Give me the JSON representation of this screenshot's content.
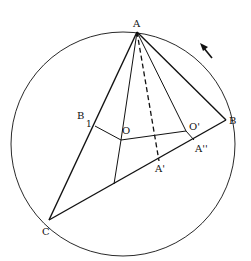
{
  "figure": {
    "type": "geometry-diagram",
    "circle": {
      "cx": 123,
      "cy": 144,
      "r": 112
    },
    "points": {
      "A": {
        "x": 137,
        "y": 32,
        "label": "A"
      },
      "B": {
        "x": 226,
        "y": 120,
        "label": "B"
      },
      "C": {
        "x": 49,
        "y": 220,
        "label": "C"
      },
      "B1": {
        "x": 95,
        "y": 126,
        "label": "B",
        "subscript": "1"
      },
      "O": {
        "x": 121,
        "y": 140,
        "label": "O"
      },
      "Op": {
        "x": 186,
        "y": 131,
        "label": "O'"
      },
      "Ap": {
        "x": 159,
        "y": 161,
        "label": "A'"
      },
      "App": {
        "x": 194,
        "y": 140,
        "label": "A''"
      },
      "D": {
        "x": 114,
        "y": 184
      }
    },
    "labels": {
      "A": "A",
      "B": "B",
      "C": "C",
      "B1_main": "B",
      "B1_sub": "1",
      "O": "O",
      "Op": "O'",
      "Ap": "A'",
      "App": "A''"
    },
    "arrow": {
      "direction": "counterclockwise",
      "x1": 212,
      "y1": 58,
      "x2": 202,
      "y2": 46
    },
    "colors": {
      "stroke": "#111111",
      "background": "#ffffff"
    }
  }
}
